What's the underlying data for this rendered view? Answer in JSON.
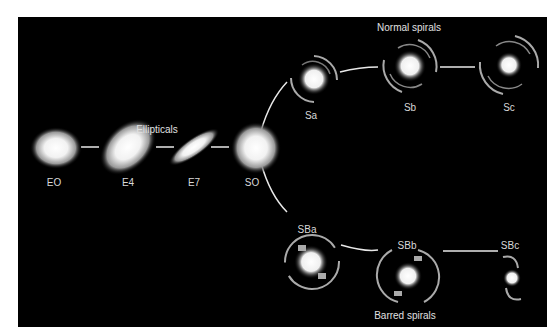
{
  "diagram": {
    "groups": {
      "ellipticals": "Ellipticals",
      "normal_spirals": "Normal spirals",
      "barred_spirals": "Barred spirals"
    },
    "ellipticals": [
      {
        "id": "E0",
        "label": "EO"
      },
      {
        "id": "E4",
        "label": "E4"
      },
      {
        "id": "E7",
        "label": "E7"
      }
    ],
    "lenticular": {
      "id": "S0",
      "label": "SO"
    },
    "normal_spirals": [
      {
        "id": "Sa",
        "label": "Sa"
      },
      {
        "id": "Sb",
        "label": "Sb"
      },
      {
        "id": "Sc",
        "label": "Sc"
      }
    ],
    "barred_spirals": [
      {
        "id": "SBa",
        "label": "SBa"
      },
      {
        "id": "SBb",
        "label": "SBb"
      },
      {
        "id": "SBc",
        "label": "SBc"
      }
    ],
    "colors": {
      "background": "#000000",
      "frame": "#ffffff",
      "connector": "#e8e8e8",
      "label": "#d8d8d8"
    }
  }
}
